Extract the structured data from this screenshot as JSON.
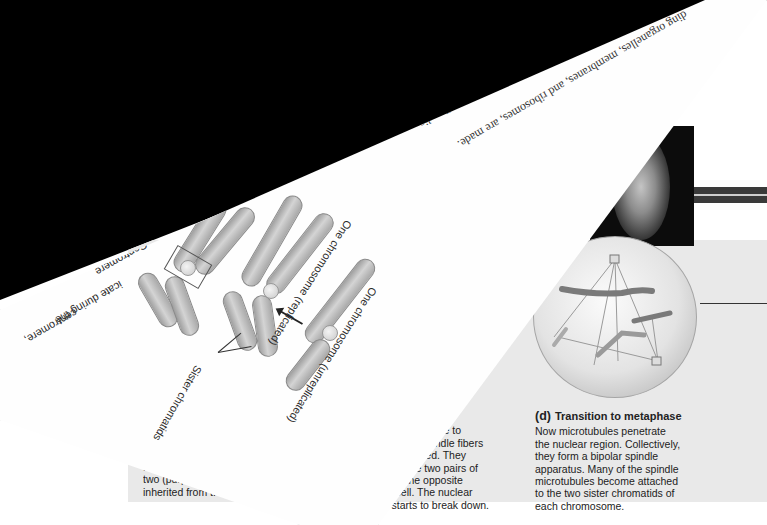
{
  "scene": {
    "description": "Photograph of overlapping biology textbook pages on a black background; one page is rotated upside down",
    "background_color": "#000000"
  },
  "figure_page": {
    "credit": "Jennifer C. Waters/Scie",
    "panel_b_fragment": {
      "lines": [
        "con",
        "color-c",
        "from the .",
        "two (purple)",
        "inherited from t."
      ]
    },
    "panel_c": {
      "letter": "",
      "title": "Late prophase",
      "body_lines": [
        "hromosomes continue to",
        "condense. New spindle fibers",
        "become assembled. They",
        "move one of the two pairs of",
        "centrioles to the opposite",
        "end of the cell. The nuclear",
        "envelope starts to break down."
      ]
    },
    "panel_d": {
      "letter": "(d)",
      "title": "Transition to metaphase",
      "body_lines": [
        "Now microtubules penetrate",
        "the nuclear region. Collectively,",
        "they form a bipolar spindle",
        "apparatus. Many of the spindle",
        "microtubules become attached",
        "to the two sister chromatids of",
        "each chromosome."
      ]
    },
    "band_arrow": "→"
  },
  "rotated_page": {
    "body_text_lines": [
      "ding organelles, membranes, and ribosomes, are made.",
      "bles the cell's size and replaces organelles dis-",
      "ll during separation of the cytoplasm. G1",
      "ing which a copy of each chromo-",
      "C2 takes place before the cell",
      "of G2, the cell is ready",
      "ase (stages",
      "kes"
    ],
    "labels": {
      "unreplicated": "One chromosome (unreplicated)",
      "replicated": "One chromosome (replicated)",
      "sister_chromatids": "Sister chromatids",
      "centromere": "Centromere",
      "fragment_1": "icate during the",
      "fragment_2": "centromere,"
    }
  }
}
